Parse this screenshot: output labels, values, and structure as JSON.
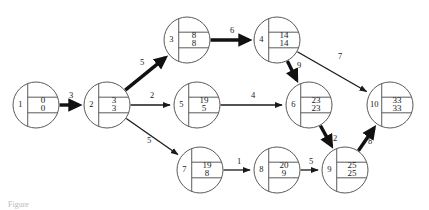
{
  "figure": {
    "caption": "Figure"
  },
  "chart_data": {
    "type": "diagram",
    "diagram_kind": "activity-on-arrow network (CPM / PERT)",
    "node_legend": {
      "left_cell": "event number",
      "top_right_cell": "earliest event time",
      "bottom_right_cell": "latest event time"
    },
    "nodes": [
      {
        "id": "1",
        "earliest": "0",
        "latest": "0",
        "cx": 36,
        "cy": 105,
        "r": 23
      },
      {
        "id": "2",
        "earliest": "3",
        "latest": "3",
        "cx": 107,
        "cy": 105,
        "r": 23
      },
      {
        "id": "3",
        "earliest": "8",
        "latest": "8",
        "cx": 187,
        "cy": 40,
        "r": 23
      },
      {
        "id": "4",
        "earliest": "14",
        "latest": "14",
        "cx": 277,
        "cy": 40,
        "r": 23
      },
      {
        "id": "5",
        "earliest": "19",
        "latest": "5",
        "cx": 197,
        "cy": 105,
        "r": 23
      },
      {
        "id": "6",
        "earliest": "23",
        "latest": "23",
        "cx": 309,
        "cy": 105,
        "r": 23
      },
      {
        "id": "7",
        "earliest": "19",
        "latest": "8",
        "cx": 200,
        "cy": 170,
        "r": 23
      },
      {
        "id": "8",
        "earliest": "20",
        "latest": "9",
        "cx": 277,
        "cy": 170,
        "r": 23
      },
      {
        "id": "9",
        "earliest": "25",
        "latest": "25",
        "cx": 345,
        "cy": 170,
        "r": 23
      },
      {
        "id": "10",
        "earliest": "33",
        "latest": "33",
        "cx": 390,
        "cy": 105,
        "r": 23
      }
    ],
    "edges": [
      {
        "from": "1",
        "to": "2",
        "weight": "3",
        "critical": true,
        "label_x": 71,
        "label_y": 96
      },
      {
        "from": "2",
        "to": "3",
        "weight": "5",
        "critical": true,
        "label_x": 142,
        "label_y": 63
      },
      {
        "from": "2",
        "to": "5",
        "weight": "2",
        "critical": false,
        "label_x": 152,
        "label_y": 96
      },
      {
        "from": "2",
        "to": "7",
        "weight": "5",
        "critical": false,
        "label_x": 149,
        "label_y": 141
      },
      {
        "from": "3",
        "to": "4",
        "weight": "6",
        "critical": true,
        "label_x": 232,
        "label_y": 31
      },
      {
        "from": "4",
        "to": "6",
        "weight": "9",
        "critical": true,
        "label_x": 299,
        "label_y": 66
      },
      {
        "from": "4",
        "to": "10",
        "weight": "7",
        "critical": false,
        "label_x": 340,
        "label_y": 57
      },
      {
        "from": "5",
        "to": "6",
        "weight": "4",
        "critical": false,
        "label_x": 253,
        "label_y": 96
      },
      {
        "from": "6",
        "to": "9",
        "weight": "2",
        "critical": true,
        "label_x": 335,
        "label_y": 139
      },
      {
        "from": "7",
        "to": "8",
        "weight": "1",
        "critical": false,
        "label_x": 239,
        "label_y": 162
      },
      {
        "from": "8",
        "to": "9",
        "weight": "5",
        "critical": false,
        "label_x": 311,
        "label_y": 162
      },
      {
        "from": "9",
        "to": "10",
        "weight": "8",
        "critical": true,
        "label_x": 370,
        "label_y": 142
      }
    ],
    "critical_path": [
      "1",
      "2",
      "3",
      "4",
      "6",
      "9",
      "10"
    ],
    "project_duration": "33"
  }
}
